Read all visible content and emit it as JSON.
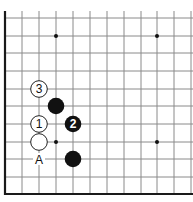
{
  "diagram": {
    "type": "go-board-corner",
    "grid": {
      "columns_x": [
        5,
        22,
        39,
        56,
        73,
        90,
        107,
        124,
        141,
        157,
        174,
        191
      ],
      "rows_y": [
        18,
        36,
        53,
        71,
        89,
        106,
        124,
        142,
        159,
        177,
        194
      ],
      "top_extent": 11,
      "right_extent": 193,
      "line_color": "#8a8a8a",
      "border_color": "#1a1a1a"
    },
    "star_points": [
      {
        "col": 3,
        "row": 1
      },
      {
        "col": 9,
        "row": 1
      },
      {
        "col": 3,
        "row": 7
      },
      {
        "col": 9,
        "row": 7
      }
    ],
    "stones": [
      {
        "color": "white",
        "col": 2,
        "row": 4,
        "label": "3"
      },
      {
        "color": "black",
        "col": 3,
        "row": 5,
        "label": ""
      },
      {
        "color": "white",
        "col": 2,
        "row": 6,
        "label": "1"
      },
      {
        "color": "black",
        "col": 4,
        "row": 6,
        "label": "2"
      },
      {
        "color": "white",
        "col": 2,
        "row": 7,
        "label": ""
      },
      {
        "color": "black",
        "col": 4,
        "row": 8,
        "label": ""
      }
    ],
    "markers": [
      {
        "col": 2,
        "row": 8,
        "label": "A"
      }
    ],
    "colors": {
      "black_stone": "#111111",
      "white_stone": "#ffffff",
      "stone_outline": "#222222"
    }
  }
}
